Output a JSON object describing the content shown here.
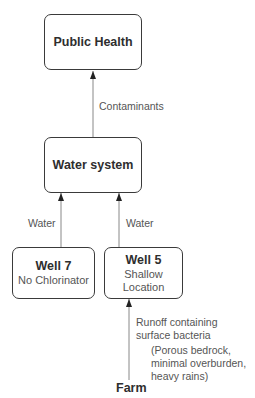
{
  "nodes": {
    "public_health": {
      "title": "Public Health"
    },
    "water_system": {
      "title": "Water system"
    },
    "well7": {
      "title": "Well 7",
      "sub": "No Chlorinator"
    },
    "well5": {
      "title": "Well 5",
      "sub1": "Shallow",
      "sub2": "Location"
    },
    "farm": {
      "title": "Farm"
    }
  },
  "edges": {
    "contaminants": "Contaminants",
    "water_left": "Water",
    "water_right": "Water",
    "runoff_line1": "Runoff containing",
    "runoff_line2": "surface bacteria",
    "conditions_line1": "(Porous bedrock,",
    "conditions_line2": "minimal overburden,",
    "conditions_line3": "heavy rains)"
  },
  "colors": {
    "stroke": "#3a3a3a",
    "line": "#888888",
    "text": "#333333"
  }
}
